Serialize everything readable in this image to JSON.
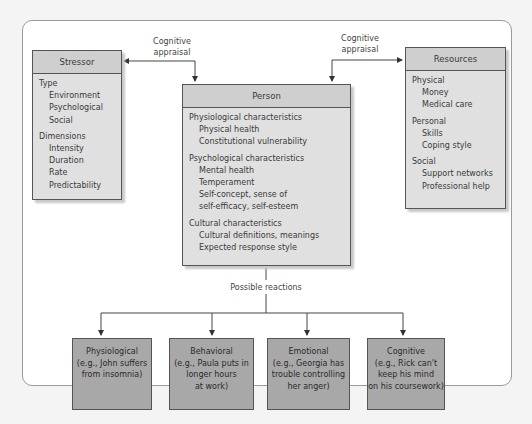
{
  "appraisal_labels": {
    "left": [
      "Cognitive",
      "appraisal"
    ],
    "right": [
      "Cognitive",
      "appraisal"
    ]
  },
  "stressor": {
    "title": "Stressor",
    "groups": [
      {
        "heading": "Type",
        "items": [
          "Environment",
          "Psychological",
          "Social"
        ]
      },
      {
        "heading": "Dimensions",
        "items": [
          "Intensity",
          "Duration",
          "Rate",
          "Predictability"
        ]
      }
    ]
  },
  "person": {
    "title": "Person",
    "groups": [
      {
        "heading": "Physiological characteristics",
        "items": [
          "Physical health",
          "Constitutional vulnerability"
        ]
      },
      {
        "heading": "Psychological characteristics",
        "items": [
          "Mental health",
          "Temperament",
          "Self-concept, sense of",
          "self-efficacy, self-esteem"
        ]
      },
      {
        "heading": "Cultural characteristics",
        "items": [
          "Cultural definitions, meanings",
          "Expected response style"
        ]
      }
    ]
  },
  "resources": {
    "title": "Resources",
    "groups": [
      {
        "heading": "Physical",
        "items": [
          "Money",
          "Medical care"
        ]
      },
      {
        "heading": "Personal",
        "items": [
          "Skills",
          "Coping style"
        ]
      },
      {
        "heading": "Social",
        "items": [
          "Support networks",
          "Professional help"
        ]
      }
    ]
  },
  "possible_reactions_label": "Possible reactions",
  "reactions": [
    {
      "lines": [
        "Physiological",
        "(e.g., John suffers",
        "from insomnia)"
      ]
    },
    {
      "lines": [
        "Behavioral",
        "(e.g., Paula puts in",
        "longer hours",
        "at work)"
      ]
    },
    {
      "lines": [
        "Emotional",
        "(e.g., Georgia has",
        "trouble controlling",
        "her anger)"
      ]
    },
    {
      "lines": [
        "Cognitive",
        "(e.g., Rick can't",
        "keep his mind",
        "on his coursework)"
      ]
    }
  ],
  "colors": {
    "box_fill": "#e0e0e0",
    "header_fill": "#cfcfcf",
    "reaction_fill": "#a8a8a8",
    "line": "#444444"
  }
}
